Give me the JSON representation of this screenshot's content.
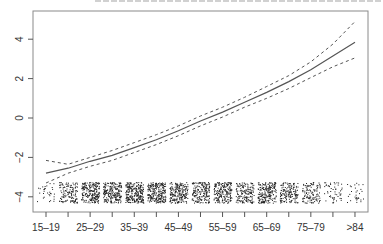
{
  "chart_data": {
    "type": "line",
    "title": "",
    "xlabel": "",
    "ylabel": "",
    "ylim": [
      -4.4,
      4.9
    ],
    "grid": false,
    "legend": null,
    "categories": [
      "15-19",
      "20-24",
      "25-29",
      "30-34",
      "35-39",
      "40-44",
      "45-49",
      "50-54",
      "55-59",
      "60-64",
      "65-69",
      "70-74",
      "75-79",
      "80-84",
      ">84"
    ],
    "x_tick_labels_shown": [
      "15-19",
      "25-29",
      "35-39",
      "45-49",
      "55-59",
      "65-69",
      "75-79",
      ">84"
    ],
    "y_ticks": [
      -4,
      -2,
      0,
      2,
      4
    ],
    "series": [
      {
        "name": "estimate",
        "style": "solid",
        "values": [
          -2.8,
          -2.55,
          -2.2,
          -1.9,
          -1.5,
          -1.1,
          -0.65,
          -0.15,
          0.3,
          0.8,
          1.3,
          1.85,
          2.45,
          3.15,
          3.85
        ]
      },
      {
        "name": "upper 95% CI",
        "style": "dashed",
        "values": [
          -2.15,
          -2.35,
          -2.0,
          -1.65,
          -1.25,
          -0.85,
          -0.4,
          0.1,
          0.55,
          1.05,
          1.6,
          2.15,
          2.85,
          3.75,
          4.9
        ]
      },
      {
        "name": "lower 95% CI",
        "style": "dashed",
        "values": [
          -3.3,
          -2.8,
          -2.45,
          -2.15,
          -1.75,
          -1.35,
          -0.9,
          -0.4,
          0.05,
          0.55,
          1.0,
          1.5,
          2.05,
          2.6,
          3.05
        ]
      }
    ],
    "rug_density": [
      0.12,
      0.5,
      0.85,
      0.85,
      0.95,
      0.9,
      0.8,
      0.7,
      0.75,
      0.6,
      0.8,
      0.6,
      0.45,
      0.2,
      0.12
    ],
    "rug_y_range": [
      -4.3,
      -3.25
    ]
  }
}
